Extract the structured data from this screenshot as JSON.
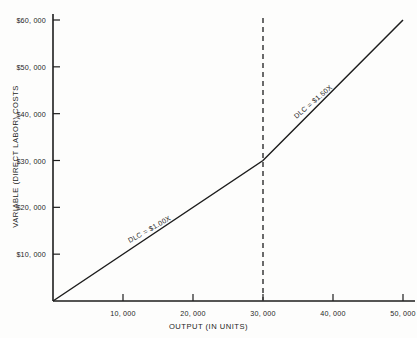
{
  "chart_data": {
    "type": "line",
    "title": "",
    "xlabel": "OUTPUT (IN UNITS)",
    "ylabel": "VARIABLE (DIRECT LABOR) COSTS",
    "xlim": [
      0,
      50000
    ],
    "ylim": [
      0,
      60000
    ],
    "grid": false,
    "legend": "none",
    "x_ticks": [
      {
        "value": 10000,
        "label": "10,000"
      },
      {
        "value": 20000,
        "label": "20,000"
      },
      {
        "value": 30000,
        "label": "30,000"
      },
      {
        "value": 40000,
        "label": "40,000"
      },
      {
        "value": 50000,
        "label": "50,000"
      }
    ],
    "y_ticks": [
      {
        "value": 10000,
        "label": "$10,000"
      },
      {
        "value": 20000,
        "label": "$20,000"
      },
      {
        "value": 30000,
        "label": "$30,000"
      },
      {
        "value": 40000,
        "label": "$40,000"
      },
      {
        "value": 50000,
        "label": "$50,000"
      },
      {
        "value": 60000,
        "label": "$60,000"
      }
    ],
    "series": [
      {
        "name": "Variable direct labor cost",
        "points": [
          {
            "x": 0,
            "y": 0
          },
          {
            "x": 30000,
            "y": 30000
          },
          {
            "x": 50000,
            "y": 60000
          }
        ]
      }
    ],
    "annotations": [
      {
        "name": "segment-1-rate",
        "text": "DLC = $1.00X",
        "x": 11500,
        "y": 11500,
        "rotation": -29.5
      },
      {
        "name": "segment-2-rate",
        "text": "DLC = $1.50X",
        "x": 35500,
        "y": 38250,
        "rotation": -40.5
      }
    ],
    "reference_lines": [
      {
        "name": "breakpoint-30000",
        "orientation": "vertical",
        "value": 30000,
        "style": "dashed",
        "color": "#3a3a3a"
      }
    ],
    "colors": {
      "line": "#1d1d1d",
      "axis": "#1d1d1d",
      "text": "#1d1d1d",
      "background": "#fdfdfc"
    }
  }
}
